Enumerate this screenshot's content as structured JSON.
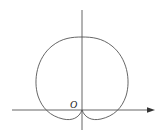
{
  "diagram": {
    "type": "polar-curve",
    "curve": "cardioid",
    "origin_label": "O",
    "colors": {
      "stroke": "#555555",
      "background": "#ffffff"
    }
  }
}
